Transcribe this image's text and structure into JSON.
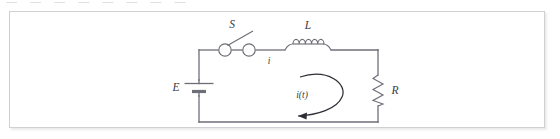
{
  "page": {
    "top_cut_text": "— —  — —   — —  — —",
    "background_color": "#ffffff"
  },
  "figure": {
    "name": "lr-series-circuit-diagram",
    "type": "electrical-circuit-schematic",
    "border_color": "#cfcfd4",
    "line_color": "#6e6e78",
    "label_color": "#3b3b44",
    "arrow_color": "#2e2e36",
    "components": [
      {
        "id": "source",
        "kind": "battery",
        "label": "E",
        "position": "left-branch",
        "description": "DC voltage source drawn as battery plates"
      },
      {
        "id": "switch",
        "kind": "switch",
        "label": "S",
        "position": "top-branch-left",
        "state": "open",
        "description": "open knife switch between two terminal circles"
      },
      {
        "id": "inductor",
        "kind": "inductor",
        "label": "L",
        "position": "top-branch-right",
        "coil_loops": 5,
        "description": "coil of five loops"
      },
      {
        "id": "resistor",
        "kind": "resistor",
        "label": "R",
        "position": "right-branch",
        "zigzag_peaks": 6,
        "description": "zigzag resistor symbol"
      }
    ],
    "annotations": [
      {
        "id": "current-top",
        "text": "i",
        "position": "below top wire, right of switch",
        "meaning": "instantaneous current in the loop"
      },
      {
        "id": "current-loop",
        "text": "i(t)",
        "position": "center of loop",
        "meaning": "time dependent loop current"
      },
      {
        "id": "loop-arrow",
        "kind": "curved-arrow",
        "direction": "counter-clockwise",
        "arrowhead": "bottom-left, pointing left",
        "meaning": "reference direction of i(t)"
      }
    ]
  }
}
